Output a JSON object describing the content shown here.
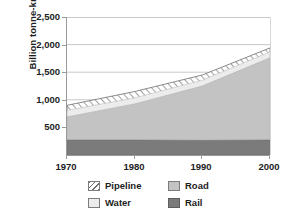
{
  "chart_data": {
    "type": "area",
    "title": "",
    "subtitle": "",
    "xlabel": "",
    "ylabel": "Billion tonne-km",
    "stacked": true,
    "grid": true,
    "legend_position": "bottom",
    "x": [
      1970,
      1980,
      1990,
      2000
    ],
    "categories": [
      "1970",
      "1980",
      "1990",
      "2000"
    ],
    "xlim": [
      1970,
      2000
    ],
    "ylim": [
      0,
      2500
    ],
    "xticklabels": [
      "1970",
      "1980",
      "1990",
      "2000"
    ],
    "yticklabels": [
      "500",
      "1,000",
      "1,500",
      "2,000",
      "2,500"
    ],
    "yticks": [
      500,
      1000,
      1500,
      2000,
      2500
    ],
    "series": [
      {
        "name": "Rail",
        "values": [
          270,
          270,
          265,
          270
        ],
        "color": "#7b7b7b",
        "pattern": "solid"
      },
      {
        "name": "Road",
        "values": [
          420,
          655,
          985,
          1490
        ],
        "color": "#c3c3c3",
        "pattern": "solid"
      },
      {
        "name": "Water",
        "values": [
          120,
          110,
          105,
          110
        ],
        "color": "#ececec",
        "pattern": "solid"
      },
      {
        "name": "Pipeline",
        "values": [
          90,
          115,
          95,
          70
        ],
        "color": "#ffffff",
        "pattern": "diagonal-hatch"
      }
    ],
    "cumulative_tops": {
      "Rail": [
        270,
        270,
        265,
        270
      ],
      "Road": [
        690,
        925,
        1250,
        1760
      ],
      "Water": [
        810,
        1035,
        1355,
        1870
      ],
      "Pipeline": [
        900,
        1150,
        1450,
        1940
      ]
    }
  },
  "legend": {
    "items": [
      {
        "label": "Pipeline",
        "swatch": "pipeline-swatch"
      },
      {
        "label": "Road",
        "swatch": "road-swatch"
      },
      {
        "label": "Water",
        "swatch": "water-swatch"
      },
      {
        "label": "Rail",
        "swatch": "rail-swatch"
      }
    ]
  },
  "colors": {
    "rail": "#7b7b7b",
    "road": "#c3c3c3",
    "water": "#ececec",
    "pipeline": "#ffffff",
    "axis": "#9a9a9a",
    "grid": "#c8c8c8",
    "text": "#1d1d1d"
  }
}
